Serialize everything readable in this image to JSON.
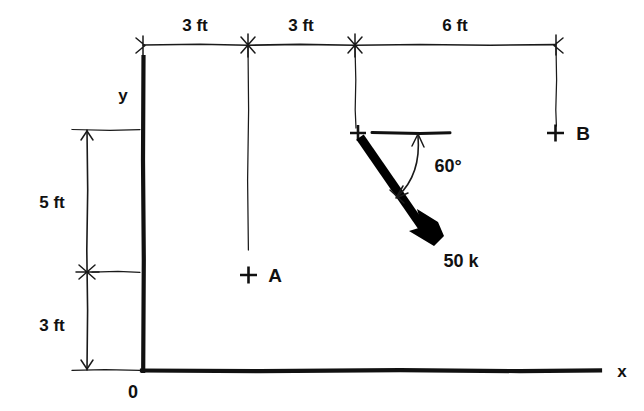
{
  "figure": {
    "background_color": "#ffffff",
    "ink_color": "#111111",
    "force_color": "#000000"
  },
  "axes": {
    "x_label": "x",
    "y_label": "y",
    "origin_label": "0"
  },
  "horizontal_dimensions": {
    "segments": [
      {
        "label": "3 ft",
        "value": 3,
        "unit": "ft"
      },
      {
        "label": "3 ft",
        "value": 3,
        "unit": "ft"
      },
      {
        "label": "6 ft",
        "value": 6,
        "unit": "ft"
      }
    ],
    "total_label": "12 ft"
  },
  "vertical_dimensions": {
    "segments": [
      {
        "label": "5 ft",
        "value": 5,
        "unit": "ft"
      },
      {
        "label": "3 ft",
        "value": 3,
        "unit": "ft"
      }
    ],
    "total_label": "8 ft"
  },
  "points": [
    {
      "name": "A",
      "label": "A",
      "marker": "plus",
      "x_ft": 3,
      "y_ft": 3
    },
    {
      "name": "B",
      "label": "B",
      "marker": "plus",
      "x_ft": 12,
      "y_ft": 8
    },
    {
      "name": "load-point",
      "label": "",
      "marker": "plus",
      "x_ft": 6,
      "y_ft": 8
    }
  ],
  "load": {
    "magnitude_label": "50 k",
    "magnitude": 50,
    "unit": "k",
    "angle_label": "60°",
    "angle_degrees": 60,
    "angle_reference": "horizontal",
    "direction": "down-right"
  }
}
